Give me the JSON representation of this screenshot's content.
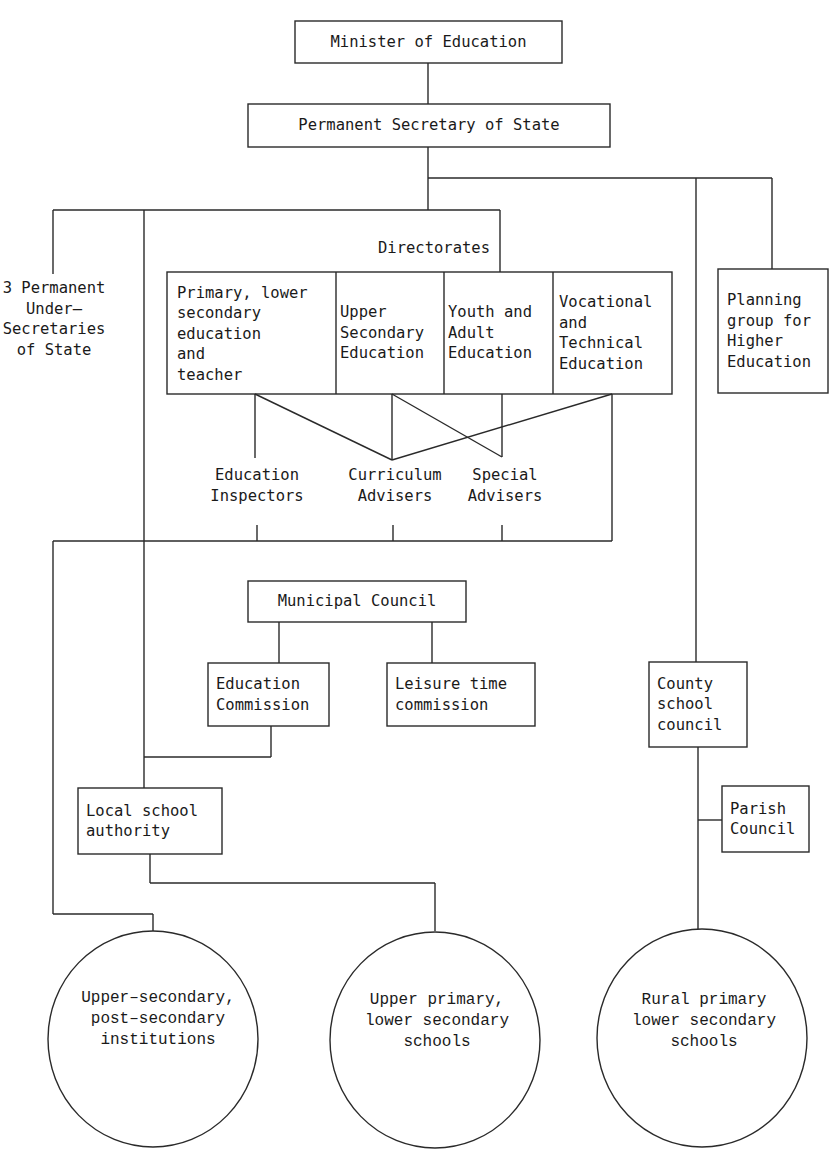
{
  "diagram": {
    "top": {
      "minister": "Minister of Education",
      "permanent_secretary": "Permanent Secretary of State"
    },
    "under_secretaries": "3 Permanent\nUnder–\nSecretaries\nof State",
    "directorates": {
      "label": "Directorates",
      "items": [
        "Primary, lower\nsecondary\neducation\nand\nteacher",
        "Upper\nSecondary\nEducation",
        "Youth and\nAdult\nEducation",
        "Vocational\nand\nTechnical\nEducation"
      ]
    },
    "planning_group": "Planning\ngroup for\nHigher\nEducation",
    "advisers": [
      "Education\nInspectors",
      "Curriculum\nAdvisers",
      "Special\nAdvisers"
    ],
    "municipal": {
      "council": "Municipal Council",
      "education_commission": "Education\nCommission",
      "leisure_commission": "Leisure time\ncommission"
    },
    "local_school_authority": "Local school\nauthority",
    "county_school_council": "County\nschool\ncouncil",
    "parish_council": "Parish\nCouncil",
    "institutions": [
      "Upper–secondary,\npost–secondary\ninstitutions",
      "Upper primary,\nlower secondary\nschools",
      "Rural primary\nlower secondary\nschools"
    ]
  }
}
